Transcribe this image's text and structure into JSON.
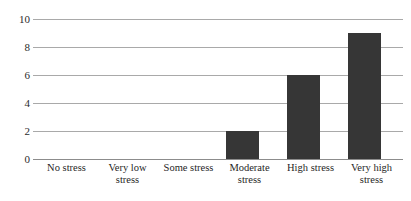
{
  "chart_data": {
    "type": "bar",
    "title": "",
    "subtitle": "",
    "xlabel": "",
    "ylabel": "",
    "categories": [
      "No stress",
      "Very low\nstress",
      "Some stress",
      "Moderate\nstress",
      "High stress",
      "Very high\nstress"
    ],
    "values": [
      0,
      0,
      0,
      2,
      6,
      9
    ],
    "ylim": [
      0,
      10
    ],
    "ytick_labels": [
      "10",
      "8",
      "6",
      "4",
      "2",
      "0"
    ],
    "ytick_values": [
      10,
      8,
      6,
      4,
      2,
      0
    ],
    "grid": true,
    "legend": "none",
    "annotations": []
  },
  "style": {
    "bar_color": "#363636",
    "gridline_color": "#a9a9a9",
    "axis_color": "#8c8c8c",
    "background_color": "#ffffff",
    "text_color": "#1f1f1f"
  }
}
